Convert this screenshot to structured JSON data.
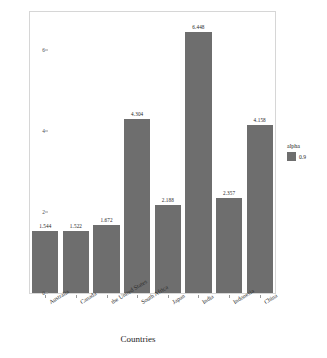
{
  "chart_data": {
    "type": "bar",
    "title": "",
    "xlabel": "Countries",
    "ylabel": "Average tax rate",
    "categories": [
      "Australia",
      "Canada",
      "the United States",
      "South Africa",
      "Japan",
      "India",
      "Indonesia",
      "China"
    ],
    "values": [
      1.544,
      1.522,
      1.672,
      4.304,
      2.188,
      6.448,
      2.357,
      4.158
    ],
    "value_labels": [
      "1.544",
      "1.522",
      "1.672",
      "4.304",
      "2.188",
      "6.448",
      "2.357",
      "4.158"
    ],
    "ylim": [
      0,
      6.95
    ],
    "yticks": [
      0,
      2,
      4,
      6
    ],
    "ytick_labels": [
      "0",
      "2",
      "4",
      "6"
    ],
    "grid": false,
    "legend": {
      "title": "alpha",
      "position": "right",
      "entries": [
        {
          "label": "0.9",
          "color": "#6e6e6e"
        }
      ]
    },
    "bar_color": "#6e6e6e",
    "panel_background": "#ffffff",
    "panel_border_color": "#d6d6d6"
  }
}
